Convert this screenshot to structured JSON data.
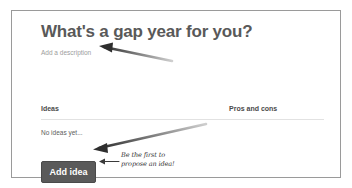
{
  "page": {
    "title": "What's a gap year for you?",
    "description_placeholder": "Add a description"
  },
  "table": {
    "headers": {
      "ideas": "Ideas",
      "pros_and_cons": "Pros and cons"
    },
    "empty_state": "No ideas yet..."
  },
  "actions": {
    "add_idea_label": "Add idea"
  },
  "annotations": {
    "description_arrow": "arrow-pointing-to-description",
    "button_arrow": "arrow-pointing-to-add-idea-button",
    "small_arrow": "small-arrow-pointing-left-to-button",
    "handwritten_note_line1": "Be the first to",
    "handwritten_note_line2": "propose an idea!"
  },
  "colors": {
    "card_border": "#9a9a9a",
    "title_text": "#595959",
    "placeholder_text": "#9d9d9d",
    "button_background": "#5a5a5a",
    "button_text": "#ffffff",
    "annotation_ink": "#333333"
  }
}
